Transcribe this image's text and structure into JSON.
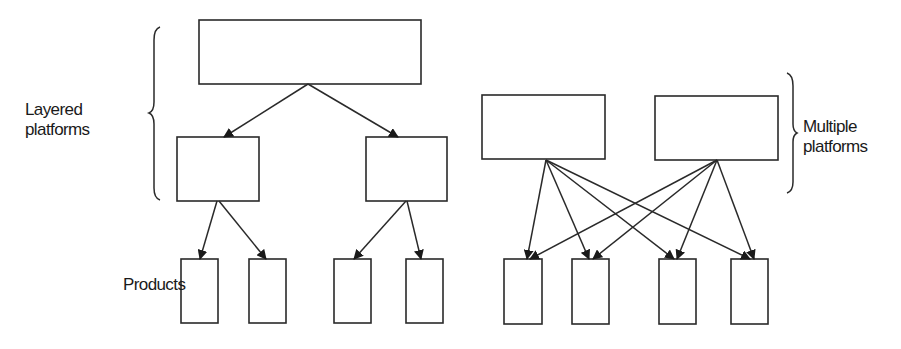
{
  "labels": {
    "layered": [
      "Layered",
      "platforms"
    ],
    "multiple": [
      "Multiple",
      "platforms"
    ],
    "products": "Products"
  },
  "colors": {
    "stroke": "#2a2a2a",
    "background": "#ffffff"
  },
  "layered": {
    "top_box": {
      "x": 199,
      "y": 20,
      "w": 222,
      "h": 64
    },
    "mid_boxes": [
      {
        "x": 177,
        "y": 137,
        "w": 82,
        "h": 64
      },
      {
        "x": 366,
        "y": 137,
        "w": 81,
        "h": 64
      }
    ],
    "product_boxes": [
      {
        "x": 181,
        "y": 259,
        "w": 37,
        "h": 64
      },
      {
        "x": 249,
        "y": 259,
        "w": 37,
        "h": 64
      },
      {
        "x": 334,
        "y": 259,
        "w": 37,
        "h": 64
      },
      {
        "x": 406,
        "y": 259,
        "w": 37,
        "h": 64
      }
    ]
  },
  "multiple": {
    "platform_boxes": [
      {
        "x": 482,
        "y": 95,
        "w": 123,
        "h": 64
      },
      {
        "x": 655,
        "y": 96,
        "w": 123,
        "h": 64
      }
    ],
    "product_boxes": [
      {
        "x": 504,
        "y": 259,
        "w": 38,
        "h": 65
      },
      {
        "x": 572,
        "y": 259,
        "w": 37,
        "h": 65
      },
      {
        "x": 659,
        "y": 259,
        "w": 37,
        "h": 65
      },
      {
        "x": 731,
        "y": 259,
        "w": 37,
        "h": 65
      }
    ]
  }
}
